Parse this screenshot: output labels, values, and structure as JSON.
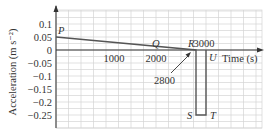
{
  "chart_data": {
    "type": "line",
    "title": "",
    "xlabel": "Time (s)",
    "ylabel": "Acceleration (m s⁻²)",
    "xlim": [
      0,
      3600
    ],
    "ylim": [
      -0.3,
      0.12
    ],
    "grid": true,
    "y_ticks": [
      "0.1",
      "0.05",
      "0",
      "−0.05",
      "−0.1",
      "−0.15",
      "−0.2",
      "−0.25"
    ],
    "x_ticks": [
      "1000",
      "2000",
      "3000"
    ],
    "points": [
      {
        "label": "P",
        "x": 0,
        "y": 0.05
      },
      {
        "label": "Q",
        "x": 2000,
        "y": 0
      },
      {
        "label": "R",
        "x": 2800,
        "y": 0
      },
      {
        "label": "S",
        "x": 2800,
        "y": -0.25
      },
      {
        "label": "T",
        "x": 3000,
        "y": -0.25
      },
      {
        "label": "U",
        "x": 3000,
        "y": 0
      }
    ],
    "series": [
      {
        "name": "acceleration",
        "x": [
          0,
          2800,
          2800,
          3000,
          3000
        ],
        "y": [
          0.05,
          0,
          -0.25,
          -0.25,
          0
        ]
      }
    ],
    "annotations": [
      {
        "text": "2800",
        "points_to": "R"
      }
    ]
  }
}
